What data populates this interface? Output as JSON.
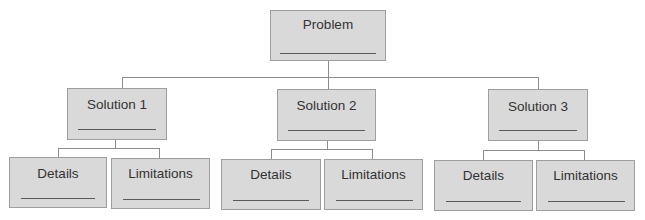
{
  "diagram": {
    "root": {
      "label": "Problem",
      "blank": ""
    },
    "solutions": [
      {
        "label": "Solution 1",
        "blank": "",
        "children": [
          {
            "label": "Details",
            "blank": ""
          },
          {
            "label": "Limitations",
            "blank": ""
          }
        ]
      },
      {
        "label": "Solution 2",
        "blank": "",
        "children": [
          {
            "label": "Details",
            "blank": ""
          },
          {
            "label": "Limitations",
            "blank": ""
          }
        ]
      },
      {
        "label": "Solution 3",
        "blank": "",
        "children": [
          {
            "label": "Details",
            "blank": ""
          },
          {
            "label": "Limitations",
            "blank": ""
          }
        ]
      }
    ],
    "colors": {
      "box_fill": "#d9d9d9",
      "box_border": "#9e9e9e",
      "connector": "#8c8c8c",
      "blank_line": "#5a5a5a",
      "text": "#333333"
    }
  }
}
